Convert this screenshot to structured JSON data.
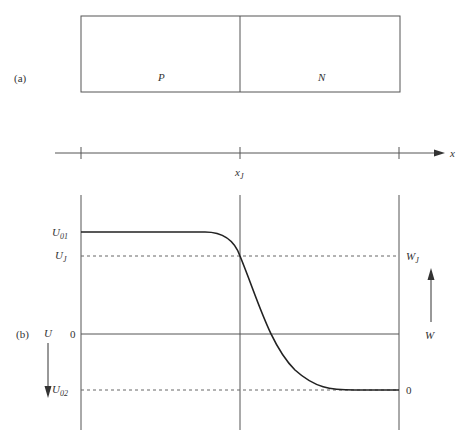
{
  "panel_a": {
    "label": "(a)",
    "regions": [
      {
        "name": "p-region",
        "label": "P"
      },
      {
        "name": "n-region",
        "label": "N"
      }
    ]
  },
  "x_axis": {
    "label": "x",
    "junction_label": "x",
    "junction_sub": "J"
  },
  "panel_b": {
    "label": "(b)",
    "left_axis": {
      "label": "U",
      "direction": "down"
    },
    "right_axis": {
      "label": "W",
      "direction": "up"
    },
    "left_ticks": [
      {
        "main": "U",
        "sub": "01"
      },
      {
        "main": "U",
        "sub": "J"
      },
      {
        "main": "0",
        "sub": ""
      },
      {
        "main": "U",
        "sub": "02"
      }
    ],
    "right_ticks": [
      {
        "main": "W",
        "sub": "J"
      },
      {
        "main": "0",
        "sub": ""
      }
    ]
  },
  "colors": {
    "line": "#333333",
    "dash": "#555555",
    "curve": "#222222"
  }
}
